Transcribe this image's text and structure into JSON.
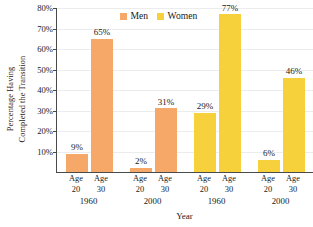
{
  "chart_data": {
    "type": "bar",
    "title": "",
    "xlabel": "Year",
    "ylabel": "Percentage Having Completed the Transition",
    "ylabel_lines": [
      "Percentage Having",
      "Completed the Transition"
    ],
    "ylim": [
      0,
      80
    ],
    "ytick_labels": [
      "10%",
      "20%",
      "30%",
      "40%",
      "50%",
      "60%",
      "70%",
      "80%"
    ],
    "ytick_values": [
      10,
      20,
      30,
      40,
      50,
      60,
      70,
      80
    ],
    "grid": true,
    "legend_position": "top-center",
    "legend": [
      {
        "name": "Men",
        "color": "#F5A868"
      },
      {
        "name": "Women",
        "color": "#F7D13C"
      }
    ],
    "categories": [
      "Age 20 (1960, Men)",
      "Age 30 (1960, Men)",
      "Age 20 (2000, Men)",
      "Age 30 (2000, Men)",
      "Age 20 (1960, Women)",
      "Age 30 (1960, Women)",
      "Age 20 (2000, Women)",
      "Age 30 (2000, Women)"
    ],
    "values": [
      9,
      65,
      2,
      31,
      29,
      77,
      6,
      46
    ],
    "value_labels": [
      "9%",
      "65%",
      "2%",
      "31%",
      "29%",
      "77%",
      "6%",
      "46%"
    ],
    "bars": [
      {
        "age_line1": "Age",
        "age_line2": "20",
        "value": 9,
        "label": "9%",
        "series": "Men",
        "color": "#F5A868",
        "group": "1960"
      },
      {
        "age_line1": "Age",
        "age_line2": "30",
        "value": 65,
        "label": "65%",
        "series": "Men",
        "color": "#F5A868",
        "group": "1960"
      },
      {
        "age_line1": "Age",
        "age_line2": "20",
        "value": 2,
        "label": "2%",
        "series": "Men",
        "color": "#F5A868",
        "group": "2000"
      },
      {
        "age_line1": "Age",
        "age_line2": "30",
        "value": 31,
        "label": "31%",
        "series": "Men",
        "color": "#F5A868",
        "group": "2000"
      },
      {
        "age_line1": "Age",
        "age_line2": "20",
        "value": 29,
        "label": "29%",
        "series": "Women",
        "color": "#F7D13C",
        "group": "1960"
      },
      {
        "age_line1": "Age",
        "age_line2": "30",
        "value": 77,
        "label": "77%",
        "series": "Women",
        "color": "#F7D13C",
        "group": "1960"
      },
      {
        "age_line1": "Age",
        "age_line2": "20",
        "value": 6,
        "label": "6%",
        "series": "Women",
        "color": "#F7D13C",
        "group": "2000"
      },
      {
        "age_line1": "Age",
        "age_line2": "30",
        "value": 46,
        "label": "46%",
        "series": "Women",
        "color": "#F7D13C",
        "group": "2000"
      }
    ],
    "group_labels": [
      "1960",
      "2000",
      "1960",
      "2000"
    ],
    "axis_color": "#4a4a4a",
    "gridline_color": "#ececec",
    "background": "#ffffff"
  }
}
